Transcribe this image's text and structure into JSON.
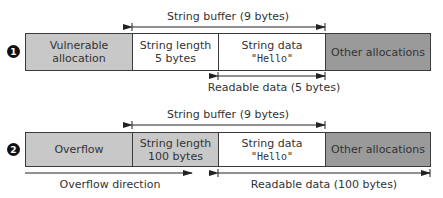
{
  "colors": {
    "light_gray": "#c8c8c8",
    "dark_gray": "#9a9a9a",
    "white": "#ffffff",
    "line": "#2a2a2a"
  },
  "diagram": {
    "row1": {
      "badge": "1",
      "buffer_label": "String buffer (9 bytes)",
      "cells": [
        {
          "line1": "Vulnerable allocation",
          "line2": "",
          "fill": "light_gray"
        },
        {
          "line1": "String length",
          "line2": "5 bytes",
          "fill": "white"
        },
        {
          "line1": "String data",
          "line2": "\"Hello\"",
          "fill": "white"
        },
        {
          "line1": "Other allocations",
          "line2": "",
          "fill": "dark_gray"
        }
      ],
      "readable_label": "Readable data (5 bytes)"
    },
    "row2": {
      "badge": "2",
      "buffer_label": "String buffer (9 bytes)",
      "cells": [
        {
          "line1": "Overflow",
          "line2": "",
          "fill": "light_gray"
        },
        {
          "line1": "String length",
          "line2": "100 bytes",
          "fill": "light_gray"
        },
        {
          "line1": "String data",
          "line2": "\"Hello\"",
          "fill": "white"
        },
        {
          "line1": "Other allocations",
          "line2": "",
          "fill": "dark_gray"
        }
      ],
      "overflow_label": "Overflow direction",
      "readable_label": "Readable data (100 bytes)"
    }
  }
}
